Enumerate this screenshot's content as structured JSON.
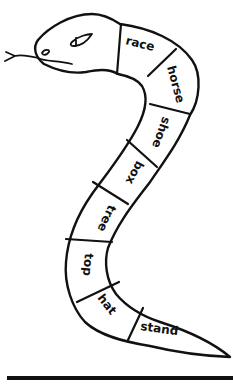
{
  "worksheet": {
    "title": "Compound word snake",
    "segments": [
      {
        "word": "race"
      },
      {
        "word": "horse"
      },
      {
        "word": "shoe"
      },
      {
        "word": "box"
      },
      {
        "word": "tree"
      },
      {
        "word": "top"
      },
      {
        "word": "hat"
      },
      {
        "word": "stand"
      }
    ]
  },
  "colors": {
    "ink": "#111111",
    "paper": "#ffffff"
  }
}
